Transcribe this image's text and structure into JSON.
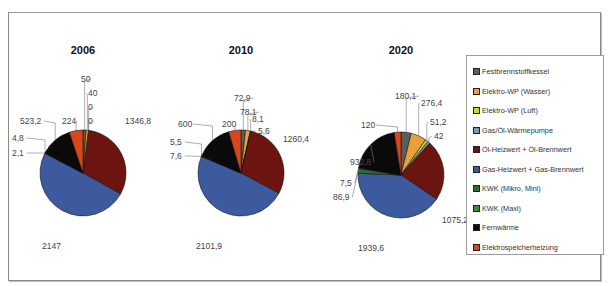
{
  "chart_data": {
    "type": "pie",
    "title": "",
    "legend_position": "right",
    "categories": [
      "Festbrennstoffkessel",
      "Elektro-WP (Wasser)",
      "Elektro-WP (Luft)",
      "Gas/Öl-Wärmepumpe",
      "Öl-Heizwert + Öl-Brennwert",
      "Gas-Heizwert + Gas-Brennwert",
      "KWK (Mikro, Mini)",
      "KWK (Maxi)",
      "Fernwärme",
      "Elektrospeicherheizung"
    ],
    "colors": [
      "#5a5e5c",
      "#e8a13a",
      "#c9d63a",
      "#7f9aa8",
      "#6b1410",
      "#3e5a9e",
      "#2f6a35",
      "#3f8a3a",
      "#0a0a0a",
      "#d9461c"
    ],
    "series": [
      {
        "name": "2006",
        "values": [
          50,
          40,
          0,
          0,
          1346.8,
          2147,
          2.1,
          4.8,
          523.2,
          224
        ],
        "labels": [
          "50",
          "40",
          "0",
          "0",
          "1346,8",
          "2147",
          "2,1",
          "4,8",
          "523,2",
          "224"
        ]
      },
      {
        "name": "2010",
        "values": [
          72.9,
          78.1,
          8.1,
          5.6,
          1260.4,
          2101.9,
          7.6,
          5.5,
          600,
          200
        ],
        "labels": [
          "72,9",
          "78,1",
          "8,1",
          "5,6",
          "1260,4",
          "2101,9",
          "7,6",
          "5,5",
          "600",
          "200"
        ]
      },
      {
        "name": "2020",
        "values": [
          180.1,
          276.4,
          51.2,
          42,
          1075.2,
          1939.6,
          86.9,
          7.5,
          932.8,
          120
        ],
        "labels": [
          "180,1",
          "276,4",
          "51,2",
          "42",
          "1075,2",
          "1939,6",
          "86,9",
          "7,5",
          "932,8",
          "120"
        ]
      }
    ]
  },
  "titles": [
    "2006",
    "2010",
    "2020"
  ],
  "legend": {
    "items": [
      "Festbrennstoffkessel",
      "Elektro-WP (Wasser)",
      "Elektro-WP (Luft)",
      "Gas/Öl-Wärmepumpe",
      "Öl-Heizwert + Öl-Brennwert",
      "Gas-Heizwert + Gas-Brennwert",
      "KWK (Mikro, Mini)",
      "KWK (Maxi)",
      "Fernwärme",
      "Elektrospeicherheizung"
    ]
  }
}
